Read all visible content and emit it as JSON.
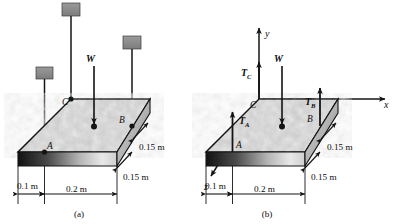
{
  "figure": {
    "panels": [
      {
        "caption": "(a)",
        "points": {
          "a": "A",
          "b": "B",
          "c": "C"
        },
        "forces": {
          "weight": "W"
        },
        "dimensions": {
          "d1": "0.1 m",
          "d2": "0.2 m",
          "d3": "0.15 m",
          "d4": "0.15 m"
        }
      },
      {
        "caption": "(b)",
        "points": {
          "a": "A",
          "b": "B",
          "c": "C"
        },
        "forces": {
          "weight": "W",
          "tension_a_base": "T",
          "tension_a_sub": "A",
          "tension_b_base": "T",
          "tension_b_sub": "B",
          "tension_c_base": "T",
          "tension_c_sub": "C"
        },
        "axes": {
          "x": "x",
          "y": "y",
          "z": "z"
        },
        "dimensions": {
          "d1": "0.1 m",
          "d2": "0.2 m",
          "d3": "0.15 m",
          "d4": "0.15 m"
        }
      }
    ],
    "colors": {
      "line": "#141414",
      "plate_top": "#c9c9c9",
      "plate_edge_dark": "#2a2a2a",
      "plate_edge_light": "#e6e6e6",
      "block_fill": "#8c8c8c",
      "background": "#ffffff"
    }
  }
}
